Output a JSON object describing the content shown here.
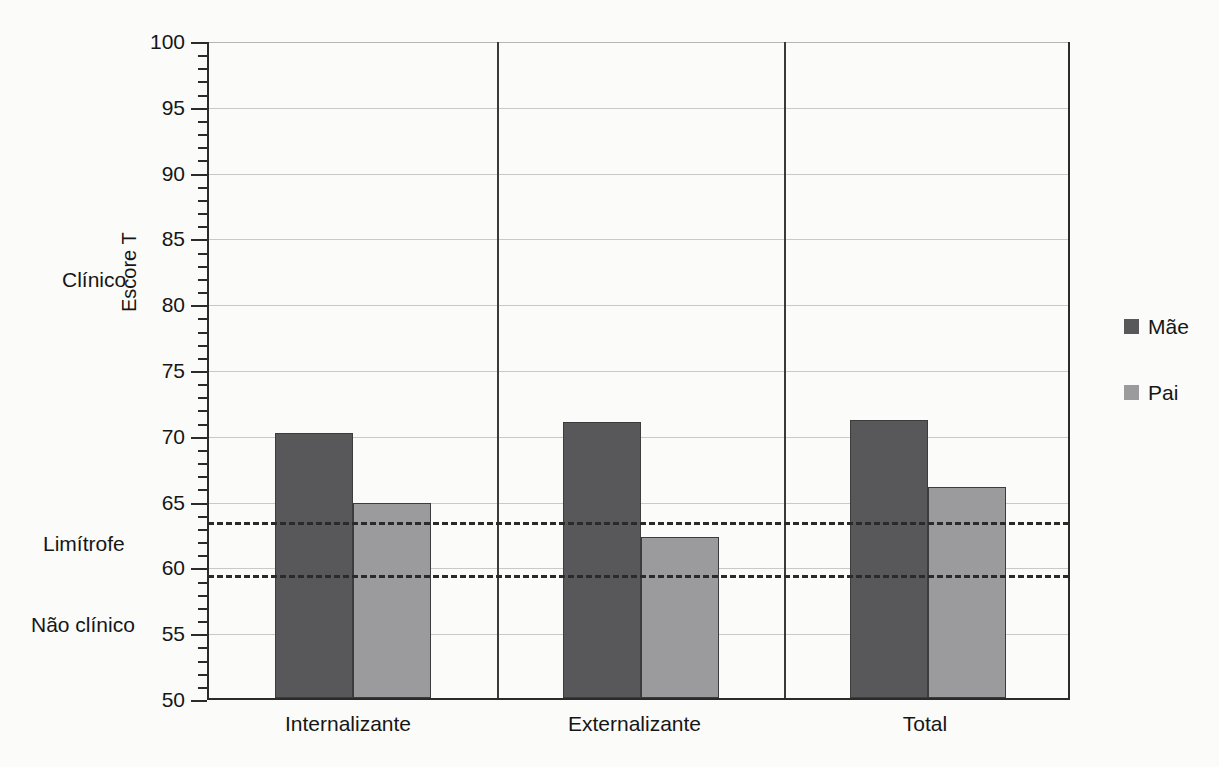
{
  "chart_data": {
    "type": "bar",
    "title": "",
    "xlabel": "",
    "ylabel": "Escore T",
    "ylim": [
      50,
      100
    ],
    "ytick_step": 5,
    "yticks": [
      50,
      55,
      60,
      65,
      70,
      75,
      80,
      85,
      90,
      95,
      100
    ],
    "ytick_labels": [
      "50",
      "55",
      "60",
      "65",
      "70",
      "75",
      "80",
      "85",
      "90",
      "95",
      "100"
    ],
    "minor_tick_step": 1,
    "grid": true,
    "legend_position": "right",
    "categories": [
      "Internalizante",
      "Externalizante",
      "Total"
    ],
    "series": [
      {
        "name": "Mãe",
        "color": "#58585a",
        "values": [
          70.1,
          71.0,
          71.1
        ]
      },
      {
        "name": "Pai",
        "color": "#9b9b9d",
        "values": [
          64.8,
          62.2,
          66.0
        ]
      }
    ],
    "threshold_lines": [
      {
        "name": "limiar-clinico",
        "value": 63.5,
        "style": "dashed"
      },
      {
        "name": "limiar-limitrofe",
        "value": 59.5,
        "style": "dashed"
      }
    ],
    "zone_labels": [
      {
        "name": "Clínico",
        "y": 81.5
      },
      {
        "name": "Limítrofe",
        "y": 61.5
      },
      {
        "name": "Não clínico",
        "y": 55.8
      }
    ],
    "group_separators": [
      1,
      2
    ]
  },
  "legend": {
    "items": [
      {
        "label": "Mãe",
        "color": "#58585a"
      },
      {
        "label": "Pai",
        "color": "#9b9b9d"
      }
    ]
  },
  "axis": {
    "y_title": "Escore T"
  }
}
